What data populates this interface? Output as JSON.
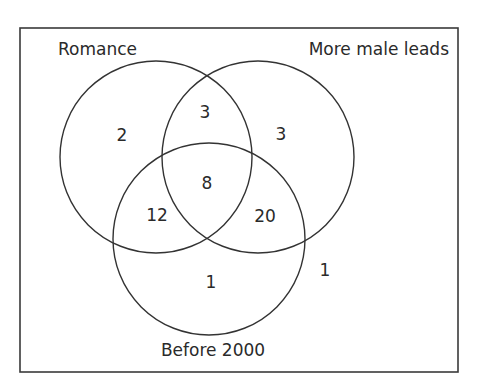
{
  "diagram": {
    "type": "venn-3",
    "sets": [
      {
        "name": "Romance",
        "label": "Romance"
      },
      {
        "name": "More male leads",
        "label": "More male leads"
      },
      {
        "name": "Before 2000",
        "label": "Before 2000"
      }
    ],
    "regions": {
      "romance_only": "2",
      "romance_and_male_only": "3",
      "male_only": "3",
      "all_three": "8",
      "romance_and_before2000_only": "12",
      "male_and_before2000_only": "20",
      "before2000_only": "1",
      "outside": "1"
    }
  }
}
